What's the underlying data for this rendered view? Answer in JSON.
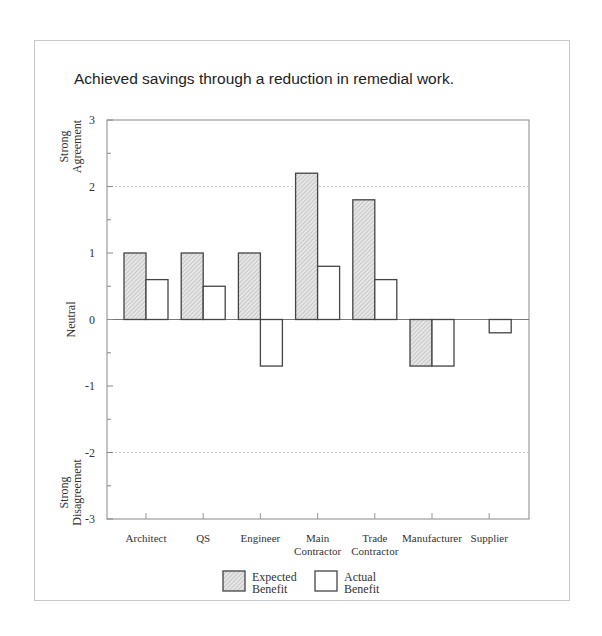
{
  "chart_data": {
    "type": "bar",
    "title": "Achieved savings through a reduction in remedial work.",
    "xlabel": "",
    "ylabel": "",
    "ylim": [
      -3,
      3
    ],
    "yticks": [
      "3",
      "2",
      "1",
      "0",
      "-1",
      "-2",
      "-3"
    ],
    "y_annotations": [
      {
        "label": "Strong Agreement",
        "at": 2.6
      },
      {
        "label": "Neutral",
        "at": 0
      },
      {
        "label": "Strong Disagreement",
        "at": -2.6
      }
    ],
    "categories": [
      "Architect",
      "QS",
      "Engineer",
      "Main Contractor",
      "Trade Contractor",
      "Manufacturer",
      "Supplier"
    ],
    "category_lines": [
      [
        "Architect"
      ],
      [
        "QS"
      ],
      [
        "Engineer"
      ],
      [
        "Main",
        "Contractor"
      ],
      [
        "Trade",
        "Contractor"
      ],
      [
        "Manufacturer"
      ],
      [
        "Supplier"
      ]
    ],
    "series": [
      {
        "name": "Expected Benefit",
        "values": [
          1.0,
          1.0,
          1.0,
          2.2,
          1.8,
          -0.7,
          0.0
        ],
        "fill": "hatched-grey"
      },
      {
        "name": "Actual Benefit",
        "values": [
          0.6,
          0.5,
          -0.7,
          0.8,
          0.6,
          -0.7,
          -0.2
        ],
        "fill": "#ffffff"
      }
    ],
    "gridlines": [
      2,
      -2
    ],
    "grid_style": "dotted",
    "legend_position": "bottom",
    "legend": [
      {
        "line1": "Expected",
        "line2": "Benefit"
      },
      {
        "line1": "Actual",
        "line2": "Benefit"
      }
    ]
  }
}
